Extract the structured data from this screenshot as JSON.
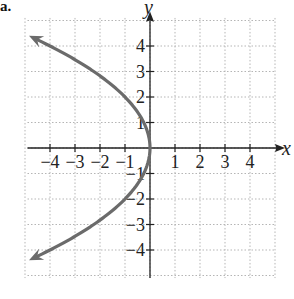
{
  "panel_label": "a.",
  "chart_data": {
    "type": "line",
    "title": "",
    "xlabel": "x",
    "ylabel": "y",
    "xlim": [
      -5,
      5
    ],
    "ylim": [
      -5,
      5
    ],
    "grid": true,
    "grid_style": "dotted",
    "x_ticks": [
      -4,
      -3,
      -2,
      -1,
      1,
      2,
      3,
      4
    ],
    "y_ticks": [
      -4,
      -3,
      -2,
      -1,
      1,
      2,
      3,
      4
    ],
    "x_tick_labels": [
      "−4",
      "−3",
      "−2",
      "−1",
      "1",
      "2",
      "3",
      "4"
    ],
    "y_tick_labels": [
      "−4",
      "−3",
      "−2",
      "−1",
      "1",
      "2",
      "3",
      "4"
    ],
    "series": [
      {
        "name": "x = -y^2/4",
        "equation": "x = -y²/4",
        "color": "#6b6b6b",
        "arrows": "both ends",
        "x": [
          -4.6,
          -4,
          -2.25,
          -1,
          -0.25,
          0,
          -0.25,
          -1,
          -2.25,
          -4,
          -4.6
        ],
        "y": [
          4.3,
          4,
          3,
          2,
          1,
          0,
          -1,
          -2,
          -3,
          -4,
          -4.3
        ]
      }
    ]
  }
}
